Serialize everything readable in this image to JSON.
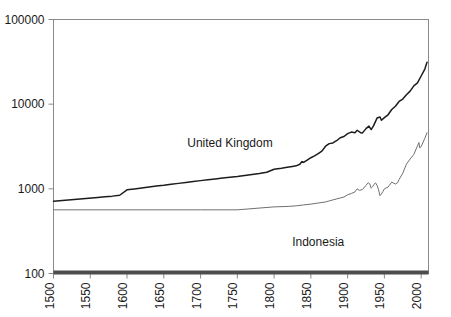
{
  "chart_data": {
    "type": "line",
    "title": "",
    "subtitle": "",
    "xlabel": "",
    "ylabel": "",
    "yscale": "log",
    "xscale": "linear",
    "xlim": [
      1500,
      2010
    ],
    "ylim": [
      100,
      100000
    ],
    "grid": false,
    "legend_position": "inline-annotations",
    "y_ticks": [
      "100",
      "1000",
      "10000",
      "100000"
    ],
    "y_tick_values": [
      100,
      1000,
      10000,
      100000
    ],
    "x_ticks": [
      "1500",
      "1550",
      "1600",
      "1650",
      "1700",
      "1750",
      "1800",
      "1850",
      "1900",
      "1950",
      "2000"
    ],
    "x_tick_values": [
      1500,
      1550,
      1600,
      1650,
      1700,
      1750,
      1800,
      1850,
      1900,
      1950,
      2000
    ],
    "annotations": [
      {
        "text": "United Kingdom",
        "x": 1740,
        "y": 3100
      },
      {
        "text": "Indonesia",
        "x": 1860,
        "y": 210
      }
    ],
    "series": [
      {
        "name": "United Kingdom",
        "color": "#1c1c1c",
        "x": [
          1500,
          1520,
          1540,
          1560,
          1570,
          1580,
          1590,
          1600,
          1610,
          1620,
          1630,
          1640,
          1650,
          1660,
          1670,
          1680,
          1690,
          1700,
          1710,
          1720,
          1730,
          1740,
          1750,
          1760,
          1770,
          1780,
          1790,
          1800,
          1810,
          1820,
          1825,
          1830,
          1835,
          1838,
          1840,
          1845,
          1850,
          1855,
          1860,
          1865,
          1870,
          1875,
          1880,
          1885,
          1890,
          1895,
          1900,
          1905,
          1910,
          1913,
          1918,
          1920,
          1925,
          1929,
          1932,
          1935,
          1938,
          1940,
          1944,
          1946,
          1950,
          1955,
          1960,
          1965,
          1970,
          1975,
          1980,
          1985,
          1990,
          1995,
          2000,
          2005,
          2008
        ],
        "y": [
          714,
          740,
          765,
          790,
          805,
          820,
          840,
          974,
          995,
          1020,
          1050,
          1080,
          1100,
          1130,
          1160,
          1190,
          1220,
          1250,
          1280,
          1310,
          1340,
          1370,
          1400,
          1440,
          1480,
          1520,
          1570,
          1700,
          1750,
          1810,
          1840,
          1870,
          1950,
          2100,
          2050,
          2180,
          2330,
          2450,
          2600,
          2790,
          3190,
          3420,
          3480,
          3700,
          4010,
          4150,
          4490,
          4680,
          4610,
          4920,
          4590,
          4550,
          5140,
          5500,
          5010,
          5500,
          6270,
          6850,
          7050,
          6450,
          6940,
          7490,
          8650,
          9450,
          10770,
          11500,
          12930,
          14250,
          16430,
          17800,
          21500,
          26000,
          31300
        ]
      },
      {
        "name": "Indonesia",
        "color": "#707070",
        "x": [
          1500,
          1550,
          1600,
          1650,
          1700,
          1750,
          1800,
          1820,
          1830,
          1840,
          1850,
          1860,
          1870,
          1875,
          1880,
          1885,
          1890,
          1895,
          1900,
          1905,
          1910,
          1913,
          1916,
          1920,
          1925,
          1928,
          1930,
          1932,
          1934,
          1936,
          1938,
          1940,
          1942,
          1944,
          1946,
          1948,
          1950,
          1955,
          1960,
          1965,
          1968,
          1970,
          1975,
          1980,
          1985,
          1990,
          1995,
          1997,
          1998,
          2000,
          2005,
          2008
        ],
        "y": [
          565,
          565,
          565,
          565,
          565,
          565,
          612,
          620,
          630,
          645,
          660,
          680,
          700,
          720,
          740,
          760,
          780,
          800,
          850,
          880,
          920,
          1000,
          960,
          980,
          1100,
          1180,
          1150,
          1020,
          1060,
          1130,
          1175,
          1100,
          980,
          830,
          870,
          930,
          1000,
          1050,
          1200,
          1140,
          1180,
          1290,
          1530,
          1960,
          2250,
          2550,
          3210,
          3520,
          3050,
          3150,
          3950,
          4600
        ]
      }
    ]
  },
  "axes": {
    "y_axis_name": "log-value-axis",
    "x_axis_name": "year-axis"
  }
}
